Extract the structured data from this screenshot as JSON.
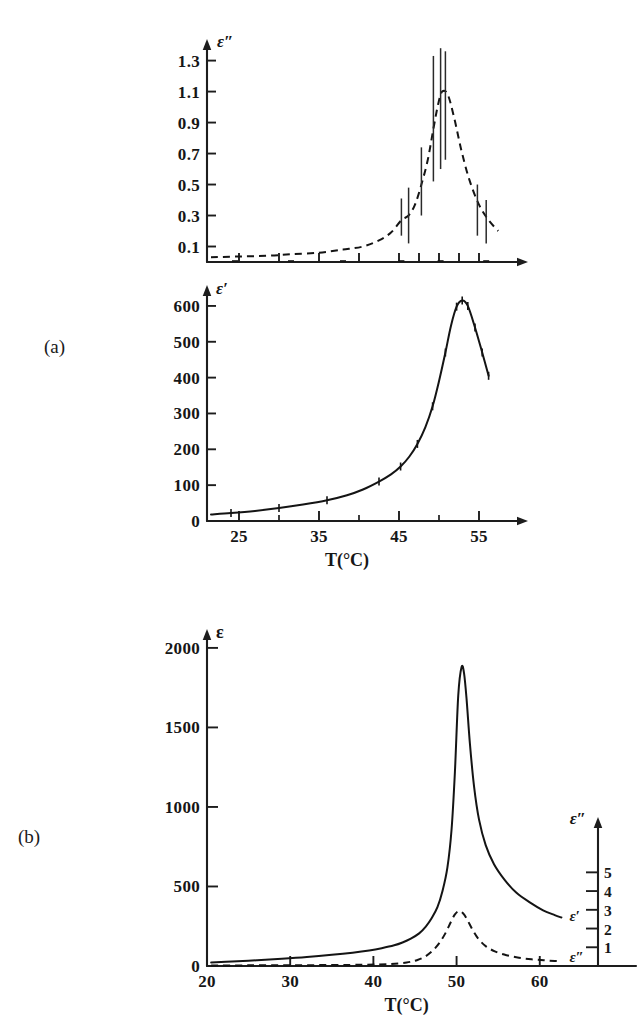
{
  "figure": {
    "background_color": "#ffffff",
    "ink_color": "#161616",
    "panels": [
      {
        "key": "a",
        "label": "(a)"
      },
      {
        "key": "b",
        "label": "(b)"
      }
    ]
  },
  "chart_data": [
    {
      "id": "panel-a-top",
      "type": "line",
      "panel": "(a)",
      "title": "",
      "ylabel": "ε″",
      "xlabel": "",
      "xlim": [
        21,
        58
      ],
      "ylim": [
        0,
        1.42
      ],
      "grid": false,
      "legend": "none",
      "style": "dashed",
      "ytick_labels": [
        "0.1",
        "0.3",
        "0.5",
        "0.7",
        "0.9",
        "1.1",
        "1.3"
      ],
      "yticks": [
        0.1,
        0.3,
        0.5,
        0.7,
        0.9,
        1.1,
        1.3
      ],
      "xticks": [
        25,
        30,
        35,
        40,
        45,
        47.5,
        50,
        52.5,
        55
      ],
      "xtick_labels": [],
      "series": [
        {
          "name": "ε″",
          "x": [
            21.5,
            24.5,
            28.5,
            31.5,
            35.0,
            38.0,
            40.5,
            42.5,
            44.0,
            45.3,
            46.2,
            47.0,
            47.8,
            48.6,
            49.3,
            49.9,
            50.4,
            51.1,
            51.9,
            52.8,
            53.8,
            55.0,
            56.2,
            57.4
          ],
          "y": [
            0.03,
            0.035,
            0.04,
            0.05,
            0.06,
            0.08,
            0.1,
            0.14,
            0.19,
            0.27,
            0.3,
            0.37,
            0.5,
            0.66,
            0.86,
            1.02,
            1.1,
            1.08,
            0.93,
            0.72,
            0.53,
            0.37,
            0.27,
            0.2
          ]
        }
      ],
      "error_bars": [
        {
          "x": 45.3,
          "y": 0.29,
          "lo": 0.17,
          "hi": 0.41
        },
        {
          "x": 46.2,
          "y": 0.3,
          "lo": 0.12,
          "hi": 0.48
        },
        {
          "x": 47.8,
          "y": 0.52,
          "lo": 0.3,
          "hi": 0.74
        },
        {
          "x": 49.3,
          "y": 0.86,
          "lo": 0.52,
          "hi": 1.33
        },
        {
          "x": 50.2,
          "y": 1.09,
          "lo": 0.6,
          "hi": 1.38
        },
        {
          "x": 50.8,
          "y": 1.1,
          "lo": 0.66,
          "hi": 1.36
        },
        {
          "x": 54.8,
          "y": 0.34,
          "lo": 0.17,
          "hi": 0.5
        },
        {
          "x": 55.9,
          "y": 0.27,
          "lo": 0.12,
          "hi": 0.4
        }
      ]
    },
    {
      "id": "panel-a-bottom",
      "type": "line",
      "panel": "(a)",
      "title": "",
      "ylabel": "ε′",
      "xlabel": "T(°C)",
      "xlim": [
        21,
        58
      ],
      "ylim": [
        0,
        650
      ],
      "grid": false,
      "legend": "none",
      "style": "solid",
      "ytick_labels": [
        "0",
        "100",
        "200",
        "300",
        "400",
        "500",
        "600"
      ],
      "yticks": [
        0,
        100,
        200,
        300,
        400,
        500,
        600
      ],
      "xticks": [
        25,
        30,
        35,
        40,
        45,
        50,
        55
      ],
      "xtick_labels": [
        "25",
        "",
        "35",
        "",
        "45",
        "",
        "55"
      ],
      "series": [
        {
          "name": "ε′",
          "x": [
            21.5,
            24.0,
            27.0,
            30.0,
            33.0,
            36.0,
            38.5,
            40.5,
            42.5,
            44.0,
            45.2,
            46.3,
            47.3,
            48.3,
            49.2,
            50.0,
            50.8,
            51.5,
            52.2,
            52.9,
            53.6,
            54.5,
            55.4,
            56.2
          ],
          "y": [
            18,
            22,
            28,
            36,
            46,
            58,
            72,
            88,
            110,
            130,
            152,
            180,
            215,
            262,
            320,
            390,
            470,
            545,
            598,
            615,
            600,
            540,
            470,
            405
          ]
        }
      ],
      "data_points_x": [
        24.0,
        30.0,
        36.0,
        42.5,
        45.2,
        47.3,
        49.2,
        50.8,
        52.2,
        52.9,
        53.6,
        54.5,
        55.4,
        56.2
      ],
      "error_bars": []
    },
    {
      "id": "panel-b",
      "type": "line",
      "panel": "(b)",
      "title": "",
      "ylabel": "ε",
      "xlabel": "T(°C)",
      "ylabel_right": "ε″",
      "xlim": [
        20,
        67
      ],
      "ylim": [
        0,
        2100
      ],
      "ylim_right": [
        0,
        6.3
      ],
      "grid": false,
      "legend": "inline-labels",
      "ytick_labels": [
        "0",
        "500",
        "1000",
        "1500",
        "2000"
      ],
      "yticks": [
        0,
        500,
        1000,
        1500,
        2000
      ],
      "ytick_labels_right": [
        "1",
        "2",
        "3",
        "4",
        "5"
      ],
      "yticks_right": [
        1,
        2,
        3,
        4,
        5
      ],
      "xticks": [
        20,
        30,
        40,
        50,
        60
      ],
      "xtick_labels": [
        "20",
        "30",
        "40",
        "50",
        "60"
      ],
      "series": [
        {
          "name": "ε′",
          "label": "ε′",
          "style": "solid",
          "axis": "left",
          "x": [
            20.5,
            23,
            26,
            29,
            32,
            35,
            37.5,
            39.5,
            41.0,
            42.5,
            43.5,
            44.5,
            45.5,
            46.3,
            47.0,
            47.7,
            48.3,
            48.9,
            49.4,
            49.8,
            50.2,
            50.6,
            50.9,
            51.2,
            51.6,
            52.1,
            52.7,
            53.5,
            54.5,
            55.8,
            57.2,
            58.8,
            60.4,
            61.8,
            62.6
          ],
          "y": [
            22,
            28,
            36,
            45,
            56,
            70,
            84,
            98,
            112,
            130,
            148,
            172,
            205,
            248,
            300,
            370,
            470,
            620,
            860,
            1220,
            1700,
            1880,
            1840,
            1680,
            1400,
            1130,
            920,
            760,
            640,
            540,
            460,
            400,
            350,
            320,
            305
          ]
        },
        {
          "name": "ε″",
          "label": "ε″",
          "style": "dashed",
          "axis": "right",
          "x": [
            20.5,
            25,
            30,
            35,
            39,
            42,
            44,
            45.3,
            46.3,
            47.2,
            48.0,
            48.7,
            49.3,
            49.8,
            50.3,
            50.8,
            51.3,
            51.9,
            52.6,
            53.5,
            54.6,
            56.0,
            57.5,
            59.0,
            60.5,
            61.8,
            62.6
          ],
          "y": [
            3,
            4,
            5,
            6,
            8,
            12,
            22,
            38,
            62,
            100,
            150,
            210,
            275,
            325,
            345,
            330,
            290,
            230,
            172,
            125,
            92,
            68,
            52,
            42,
            36,
            32,
            30
          ]
        }
      ],
      "curve_labels": [
        {
          "text": "ε′",
          "series": "ε′"
        },
        {
          "text": "ε″",
          "series": "ε″"
        }
      ]
    }
  ]
}
